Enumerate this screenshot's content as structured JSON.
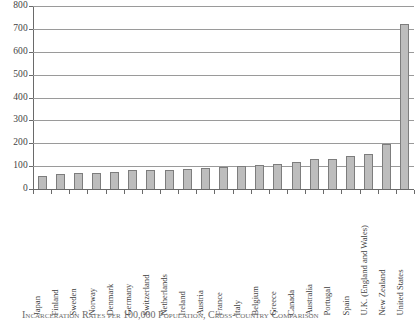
{
  "chart_data": {
    "type": "bar",
    "title": "",
    "xlabel": "",
    "ylabel": "",
    "ylim": [
      0,
      800
    ],
    "yticks": [
      0,
      100,
      200,
      300,
      400,
      500,
      600,
      700,
      800
    ],
    "ytick_labels": [
      "0",
      "100",
      "200",
      "300",
      "400",
      "500",
      "600",
      "700",
      "800"
    ],
    "grid": "horizontal",
    "legend": "none",
    "bar_fill_color": "#bdbdbd",
    "bar_edge_color": "#7d7d7d",
    "axis_color": "#6a6a6a",
    "categories": [
      "Japan",
      "Finland",
      "Sweden",
      "Norway",
      "Denmark",
      "Germany",
      "Switzerland",
      "Netherlands",
      "Ireland",
      "Austria",
      "France",
      "Italy",
      "Belgium",
      "Greece",
      "Canada",
      "Australia",
      "Portugal",
      "Spain",
      "U.K. (England and Wales)",
      "New Zealand",
      "United States"
    ],
    "values": [
      55,
      65,
      68,
      69,
      73,
      81,
      83,
      85,
      88,
      92,
      95,
      100,
      104,
      110,
      118,
      130,
      133,
      145,
      152,
      196,
      723
    ]
  },
  "caption": {
    "text": "Incarceration Rates per 100,000 Population, Cross-country Comparison"
  }
}
